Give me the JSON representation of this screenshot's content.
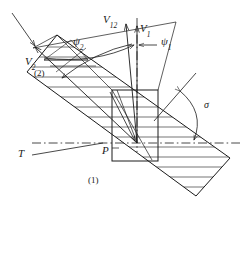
{
  "figure": {
    "type": "technical-vector-diagram",
    "title": "",
    "background_color": "#ffffff",
    "stroke_color": "#1a1a1a",
    "width": 247,
    "height": 257
  },
  "labels": {
    "v12": {
      "base": "V",
      "sub": "12",
      "x": 103,
      "y": 20,
      "size": 11
    },
    "v1": {
      "base": "V",
      "sub": "1",
      "x": 140,
      "y": 29,
      "size": 11
    },
    "v2": {
      "base": "V",
      "sub": "2",
      "x": 29,
      "y": 62,
      "size": 11
    },
    "psi2": {
      "base": "ψ",
      "sub": "2",
      "x": 75,
      "y": 43,
      "size": 11
    },
    "psi1": {
      "base": "ψ",
      "sub": "1",
      "x": 160,
      "y": 43,
      "size": 11
    },
    "sigma": {
      "base": "σ",
      "sub": "",
      "x": 202,
      "y": 105,
      "size": 10
    },
    "point_p": {
      "base": "P",
      "sub": "",
      "x": 103,
      "y": 150,
      "size": 11
    },
    "t_label": {
      "base": "T",
      "sub": "",
      "x": 20,
      "y": 153,
      "size": 11
    },
    "region_1": {
      "base": "(1)",
      "sub": "",
      "x": 90,
      "y": 182,
      "size": 9
    },
    "region_2": {
      "base": "(2)",
      "sub": "",
      "x": 35,
      "y": 75,
      "size": 9
    }
  },
  "geometry": {
    "slab": {
      "name": "hatched-band",
      "corners": [
        [
          27,
          72
        ],
        [
          57,
          35
        ],
        [
          230,
          158
        ],
        [
          196,
          196
        ]
      ],
      "hatch_line_count": 16
    },
    "rectangle": {
      "name": "vertical-section-box",
      "x": 112,
      "y": 90,
      "width": 46,
      "height": 71
    },
    "axis_T": {
      "name": "horizontal-dash-dot-axis",
      "x1": 32,
      "y1": 143,
      "x2": 240,
      "y2": 143,
      "style": "dash-dot"
    },
    "axis_vertical": {
      "name": "vertical-dash-dot-axis",
      "x1": 137,
      "y1": 20,
      "x2": 137,
      "y2": 150,
      "style": "dash-dot"
    },
    "sigma_arc": {
      "name": "sigma-angle-arc",
      "from": [
        176,
        97
      ],
      "to": [
        196,
        141
      ],
      "ray_start": [
        158,
        119
      ],
      "ray_end": [
        196,
        75
      ]
    }
  },
  "vectors": [
    {
      "name": "V1",
      "from": [
        137,
        143
      ],
      "to": [
        137,
        30
      ],
      "label": "V1"
    },
    {
      "name": "V12",
      "from": [
        137,
        143
      ],
      "to": [
        127,
        27
      ],
      "label": "V12"
    },
    {
      "name": "V2",
      "from": [
        137,
        143
      ],
      "to": [
        33,
        48
      ],
      "label": "V2"
    }
  ]
}
